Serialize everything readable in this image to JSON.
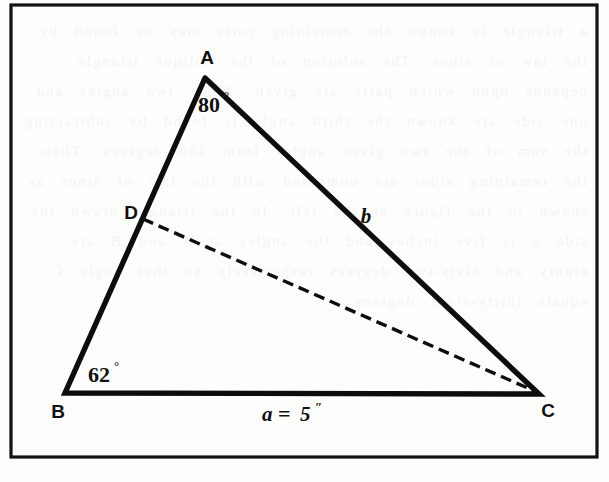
{
  "figure": {
    "background_color": "#fdfdfc",
    "ink_color": "#0d0d0d",
    "frame": {
      "name": "figure-border",
      "x": 11,
      "y": 5,
      "width": 586,
      "height": 452
    },
    "vertices": [
      {
        "id": "A",
        "label": "A",
        "x": 205,
        "y": 78,
        "label_x": 207,
        "label_y": 64
      },
      {
        "id": "B",
        "label": "B",
        "x": 65,
        "y": 393,
        "label_x": 58,
        "label_y": 418
      },
      {
        "id": "C",
        "label": "C",
        "x": 539,
        "y": 394,
        "label_x": 548,
        "label_y": 417
      },
      {
        "id": "D",
        "label": "D",
        "x": 143,
        "y": 219,
        "label_x": 131,
        "label_y": 219
      }
    ],
    "sides": [
      {
        "id": "AB",
        "from": "A",
        "to": "B",
        "style": "solid"
      },
      {
        "id": "AC",
        "from": "A",
        "to": "C",
        "style": "solid",
        "label": "b"
      },
      {
        "id": "BC",
        "from": "B",
        "to": "C",
        "style": "solid",
        "label": "a = 5″"
      },
      {
        "id": "DC",
        "from": "D",
        "to": "C",
        "style": "dashed"
      }
    ],
    "angles": [
      {
        "at": "A",
        "value": "80",
        "degree_symbol": "°",
        "label": "80°",
        "x": 198,
        "y": 112
      },
      {
        "at": "B",
        "value": "62",
        "degree_symbol": "°",
        "label": "62°",
        "x": 88,
        "y": 382
      }
    ],
    "side_labels": [
      {
        "id": "label-b",
        "text": "b",
        "x": 366,
        "y": 223
      },
      {
        "id": "label-a",
        "text": "a = 5″",
        "x": 262,
        "y": 421
      }
    ],
    "base_label_parts": {
      "variable": "a",
      "equals": "=",
      "value": "5",
      "unit": "″"
    },
    "ghost_text": "a triangle is known the remaining parts may be found by the law of sines. The solution of the oblique triangle depends upon which parts are given. When two angles and one side are known the third angle is found by subtracting the sum of the two given angles from 180 degrees. Then the remaining sides are computed with the law of sines as shown in the figure at the left. In the triangle drawn the side a is five inches and the angles at A and B are eighty and sixty-two degrees respectively so that angle C equals thirty-eight degrees."
  }
}
